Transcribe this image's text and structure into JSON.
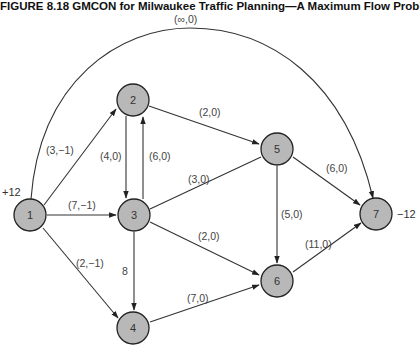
{
  "figure": {
    "title": "FIGURE 8.18   GMCON for Milwaukee Traffic Planning—A Maximum Flow Problem"
  },
  "nodes": [
    {
      "id": "1",
      "label": "1",
      "x": 30,
      "y": 215,
      "supply": "+12"
    },
    {
      "id": "2",
      "label": "2",
      "x": 133,
      "y": 100
    },
    {
      "id": "3",
      "label": "3",
      "x": 134,
      "y": 215
    },
    {
      "id": "4",
      "label": "4",
      "x": 133,
      "y": 328
    },
    {
      "id": "5",
      "label": "5",
      "x": 277,
      "y": 149
    },
    {
      "id": "6",
      "label": "6",
      "x": 277,
      "y": 281
    },
    {
      "id": "7",
      "label": "7",
      "x": 376,
      "y": 214,
      "supply": "−12"
    }
  ],
  "edges": [
    {
      "from": "1",
      "to": "7",
      "label": "(∞,0)"
    },
    {
      "from": "1",
      "to": "2",
      "label": "(3,−1)"
    },
    {
      "from": "1",
      "to": "3",
      "label": "(7,−1)"
    },
    {
      "from": "1",
      "to": "4",
      "label": "(2,−1)"
    },
    {
      "from": "2",
      "to": "3",
      "label": "(4,0)"
    },
    {
      "from": "3",
      "to": "2",
      "label": "(6,0)"
    },
    {
      "from": "2",
      "to": "5",
      "label": "(2,0)"
    },
    {
      "from": "3",
      "to": "5",
      "label": "(3,0)"
    },
    {
      "from": "3",
      "to": "6",
      "label": "(2,0)"
    },
    {
      "from": "3",
      "to": "4",
      "label": "8"
    },
    {
      "from": "4",
      "to": "6",
      "label": "(7,0)"
    },
    {
      "from": "5",
      "to": "6",
      "label": "(5,0)"
    },
    {
      "from": "5",
      "to": "7",
      "label": "(6,0)"
    },
    {
      "from": "6",
      "to": "7",
      "label": "(11,0)"
    }
  ]
}
